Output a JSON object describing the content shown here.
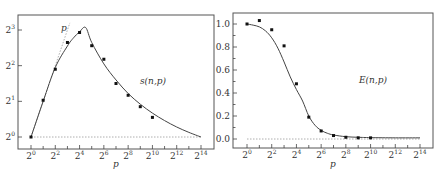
{
  "chart_data": [
    {
      "type": "line",
      "title": "",
      "annotation": "s(n,p)",
      "reference_line_label": "p",
      "xlabel": "p",
      "ylabel": "",
      "x_scale": "log2",
      "y_scale": "log2",
      "xlim_log2": [
        0,
        14
      ],
      "ylim_log2": [
        0,
        3
      ],
      "x_ticks": [
        {
          "base": "2",
          "exp": "0"
        },
        {
          "base": "2",
          "exp": "2"
        },
        {
          "base": "2",
          "exp": "4"
        },
        {
          "base": "2",
          "exp": "6"
        },
        {
          "base": "2",
          "exp": "8"
        },
        {
          "base": "2",
          "exp": "10"
        },
        {
          "base": "2",
          "exp": "12"
        },
        {
          "base": "2",
          "exp": "14"
        }
      ],
      "x_minor_ticks_log2": [
        1,
        3,
        5,
        7,
        9,
        11,
        13
      ],
      "y_ticks": [
        {
          "base": "2",
          "exp": "0",
          "v": 0
        },
        {
          "base": "2",
          "exp": "1",
          "v": 1
        },
        {
          "base": "2",
          "exp": "2",
          "v": 2
        },
        {
          "base": "2",
          "exp": "3",
          "v": 3
        }
      ],
      "points_log2": {
        "x": [
          0,
          1,
          2,
          3,
          4,
          5,
          6,
          7,
          8,
          9,
          10
        ],
        "y": [
          0,
          1.03,
          1.9,
          2.65,
          2.93,
          2.56,
          2.18,
          1.5,
          1.17,
          0.85,
          0.55
        ]
      },
      "model_curve_log2": {
        "x": [
          0,
          1,
          2,
          3,
          3.5,
          4,
          4.5,
          5,
          6,
          7,
          8,
          9,
          10,
          11,
          12,
          13,
          14
        ],
        "y": [
          0,
          1.0,
          1.95,
          2.55,
          2.78,
          2.95,
          3.07,
          2.65,
          2.05,
          1.6,
          1.22,
          0.92,
          0.67,
          0.46,
          0.28,
          0.13,
          0.0
        ]
      },
      "reference_line_log2": {
        "x": [
          0,
          3.2
        ],
        "y": [
          0,
          3.2
        ]
      },
      "baseline_log2": 0
    },
    {
      "type": "line",
      "title": "",
      "annotation": "E(n,p)",
      "xlabel": "p",
      "ylabel": "",
      "x_scale": "log2",
      "xlim_log2": [
        0,
        14
      ],
      "ylim": [
        0.0,
        1.0
      ],
      "x_ticks": [
        {
          "base": "2",
          "exp": "0"
        },
        {
          "base": "2",
          "exp": "2"
        },
        {
          "base": "2",
          "exp": "4"
        },
        {
          "base": "2",
          "exp": "6"
        },
        {
          "base": "2",
          "exp": "8"
        },
        {
          "base": "2",
          "exp": "10"
        },
        {
          "base": "2",
          "exp": "12"
        },
        {
          "base": "2",
          "exp": "14"
        }
      ],
      "x_minor_ticks_log2": [
        1,
        3,
        5,
        7,
        9,
        11,
        13
      ],
      "y_ticks": [
        {
          "label": "0.0",
          "v": 0.0
        },
        {
          "label": "0.2",
          "v": 0.2
        },
        {
          "label": "0.4",
          "v": 0.4
        },
        {
          "label": "0.6",
          "v": 0.6
        },
        {
          "label": "0.8",
          "v": 0.8
        },
        {
          "label": "1.0",
          "v": 1.0
        }
      ],
      "y_minor_ticks": [
        0.1,
        0.3,
        0.5,
        0.7,
        0.9
      ],
      "points": {
        "x_log2": [
          0,
          1,
          2,
          3,
          4,
          5,
          6,
          7,
          8,
          9,
          10
        ],
        "y": [
          1.0,
          1.03,
          0.95,
          0.81,
          0.48,
          0.19,
          0.07,
          0.03,
          0.015,
          0.01,
          0.01
        ]
      },
      "model_curve": {
        "x_log2": [
          0,
          0.5,
          1,
          1.5,
          2,
          2.5,
          3,
          3.5,
          4,
          4.5,
          5,
          5.5,
          6,
          6.5,
          7,
          8,
          9,
          10,
          12,
          14
        ],
        "y": [
          1.0,
          0.99,
          0.975,
          0.94,
          0.88,
          0.79,
          0.67,
          0.54,
          0.43,
          0.33,
          0.2,
          0.12,
          0.075,
          0.05,
          0.035,
          0.02,
          0.015,
          0.012,
          0.01,
          0.01
        ]
      },
      "baseline": 0.0
    }
  ]
}
